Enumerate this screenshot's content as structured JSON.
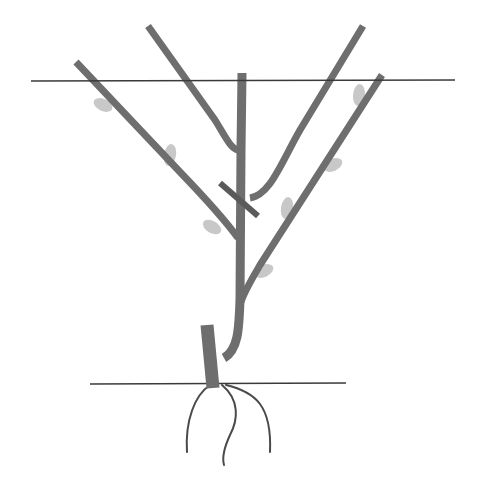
{
  "diagram": {
    "title": "",
    "type": "tree-pruning-illustration",
    "canvas": {
      "width": 484,
      "height": 480,
      "background": "#ffffff"
    },
    "colors": {
      "wood": "#6e6e6e",
      "leaf": "#c8c8c8",
      "wire": "#3a3a3a",
      "ground": "#3a3a3a",
      "root": "#4a4a4a",
      "cut_mark": "#5a5a5a"
    },
    "wire": {
      "label": "support-wire",
      "x1": 31,
      "y1": 81,
      "x2": 455,
      "y2": 80
    },
    "ground_line": {
      "label": "ground-level",
      "x1": 90,
      "y1": 384,
      "x2": 346,
      "y2": 383
    },
    "trunk_stub": {
      "label": "old-stub",
      "path": "M207,325 L213,388"
    },
    "central_leader": {
      "label": "central-leader",
      "path": "M242,73 L241,150 L240,300 C239,330 238,350 224,358"
    },
    "branches": [
      {
        "label": "left-outer-branch",
        "path": "M76,62 L180,172 C205,198 225,220 238,238"
      },
      {
        "label": "left-inner-branch",
        "path": "M148,26 L215,120 C225,136 230,148 238,150"
      },
      {
        "label": "right-outer-branch",
        "path": "M363,26 L300,130 C280,165 270,195 250,198"
      },
      {
        "label": "right-inner-branch",
        "path": "M382,75 L260,265 C250,282 244,292 241,302"
      }
    ],
    "cut_mark": {
      "label": "pruning-cut",
      "x1": 220,
      "y1": 183,
      "x2": 258,
      "y2": 216
    },
    "leaves": [
      {
        "label": "leaf-1",
        "cx": 103,
        "cy": 105,
        "rx": 10,
        "ry": 6,
        "rotate": 25
      },
      {
        "label": "leaf-2",
        "cx": 170,
        "cy": 155,
        "rx": 6,
        "ry": 11,
        "rotate": 10
      },
      {
        "label": "leaf-3",
        "cx": 212,
        "cy": 227,
        "rx": 10,
        "ry": 6,
        "rotate": 30
      },
      {
        "label": "leaf-4",
        "cx": 359,
        "cy": 95,
        "rx": 6,
        "ry": 11,
        "rotate": 5
      },
      {
        "label": "leaf-5",
        "cx": 333,
        "cy": 165,
        "rx": 10,
        "ry": 6,
        "rotate": -25
      },
      {
        "label": "leaf-6",
        "cx": 287,
        "cy": 208,
        "rx": 6,
        "ry": 11,
        "rotate": 10
      },
      {
        "label": "leaf-7",
        "cx": 264,
        "cy": 271,
        "rx": 10,
        "ry": 6,
        "rotate": -25
      }
    ],
    "roots": [
      {
        "label": "root-left",
        "path": "M210,385 C195,395 185,420 187,452"
      },
      {
        "label": "root-middle",
        "path": "M222,385 C240,400 238,420 230,435 C224,448 222,458 224,465"
      },
      {
        "label": "root-right",
        "path": "M226,385 C255,392 272,405 270,452"
      }
    ]
  }
}
